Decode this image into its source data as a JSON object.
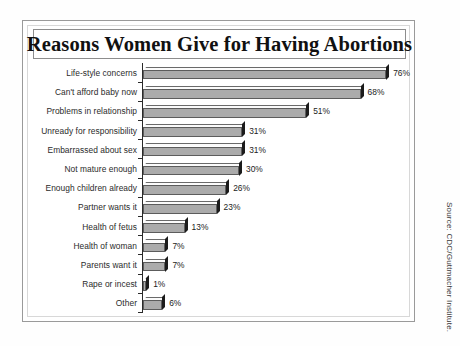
{
  "chart_data": {
    "type": "bar",
    "orientation": "horizontal",
    "title": "Reasons Women Give for Having Abortions",
    "xlabel": "",
    "ylabel": "",
    "xlim": [
      0,
      80
    ],
    "grid": false,
    "legend": null,
    "value_suffix": "%",
    "source": "Source: CDC/Guttmacher Institute.",
    "categories": [
      "Life-style concerns",
      "Can't afford baby now",
      "Problems in relationship",
      "Unready for responsibility",
      "Embarrassed about sex",
      "Not mature enough",
      "Enough children already",
      "Partner wants it",
      "Health of fetus",
      "Health of woman",
      "Parents want it",
      "Rape or incest",
      "Other"
    ],
    "values": [
      76,
      68,
      51,
      31,
      31,
      30,
      26,
      23,
      13,
      7,
      7,
      1,
      6
    ],
    "value_labels": [
      "76%",
      "68%",
      "51%",
      "31%",
      "31%",
      "30%",
      "26%",
      "23%",
      "13%",
      "7%",
      "7%",
      "1%",
      "6%"
    ],
    "colors": {
      "bar_front": "#ababab",
      "bar_top": "#fbfbfb",
      "bar_side": "#1b1b1b",
      "bar_outline": "#5c5c5c",
      "axis": "#2a2a2a",
      "background": "#ffffff",
      "text": "#222222"
    }
  }
}
